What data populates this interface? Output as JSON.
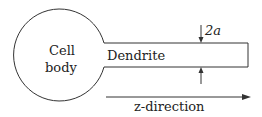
{
  "diagram": {
    "cell_body_label_line1": "Cell",
    "cell_body_label_line2": "body",
    "dendrite_label": "Dendrite",
    "radius_label": "2a",
    "direction_label": "z-direction",
    "colors": {
      "stroke": "#333333",
      "background": "#ffffff"
    }
  }
}
